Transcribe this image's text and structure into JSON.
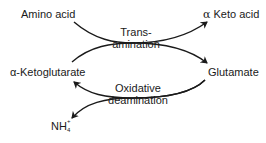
{
  "diagram": {
    "type": "biochemical-pathway",
    "nodes": {
      "amino_acid": "Amino acid",
      "alpha_keto_acid_symbol": "α",
      "alpha_keto_acid_text": "Keto acid",
      "alpha_ketoglutarate": "α-Ketoglutarate",
      "glutamate": "Glutamate",
      "ammonium_base": "NH",
      "ammonium_sub": "4",
      "ammonium_sup": "+"
    },
    "processes": {
      "transamination_line1": "Trans-",
      "transamination_line2": "amination",
      "oxidative_deamination_line1": "Oxidative",
      "oxidative_deamination_line2": "deamination"
    },
    "edges": [
      {
        "from": "Amino acid",
        "to": "α Keto acid",
        "via": "Transamination"
      },
      {
        "from": "α-Ketoglutarate",
        "to": "Glutamate",
        "via": "Transamination"
      },
      {
        "from": "Glutamate",
        "to": "α-Ketoglutarate",
        "via": "Oxidative deamination"
      },
      {
        "from": "Glutamate",
        "to": "NH4+",
        "via": "Oxidative deamination"
      }
    ],
    "colors": {
      "line": "#1a1a1a",
      "text": "#1a1a1a",
      "background": "#ffffff"
    }
  }
}
